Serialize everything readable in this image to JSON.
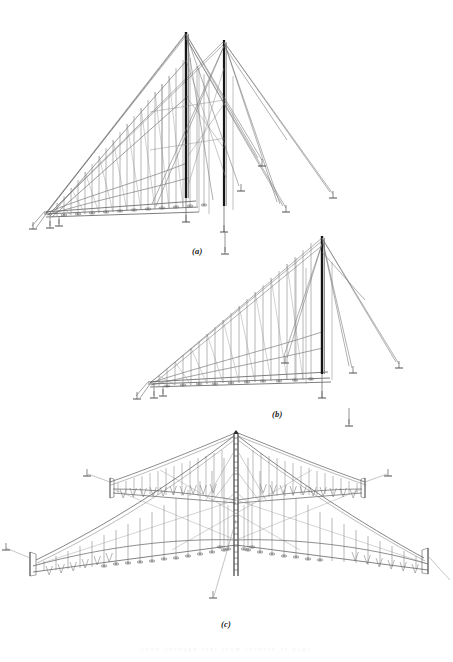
{
  "figure": {
    "background_color": "#ffffff",
    "ink_color": "#4a4a4a",
    "mast_color": "#1c1c1c",
    "cable_color": "#6f6f6f",
    "hanger_color": "#7d7d7d",
    "width": 453,
    "height": 662
  },
  "captions": {
    "a": "(a)",
    "b": "(b)",
    "c": "(c)"
  },
  "panels": [
    {
      "id": "a",
      "label": "(a)",
      "description": "Two-mast cable-stayed suspended structure in perspective, deck receding to the left",
      "mast_count": 2,
      "hanger_count": 22,
      "backstay_count": 6,
      "anchor_count": 5
    },
    {
      "id": "b",
      "label": "(b)",
      "description": "Single-mast cable-stayed suspended structure in perspective, deck receding to the left",
      "mast_count": 1,
      "hanger_count": 20,
      "backstay_count": 5,
      "anchor_count": 4
    },
    {
      "id": "c",
      "label": "(c)",
      "description": "Symmetric four-wing cruciform cable net suspended from a single central latticed mast",
      "mast_count": 1,
      "wing_count": 4,
      "hanger_count": 64,
      "anchor_count": 6
    }
  ],
  "bleed_text": {
    "line": "show-through text from reverse of page"
  }
}
